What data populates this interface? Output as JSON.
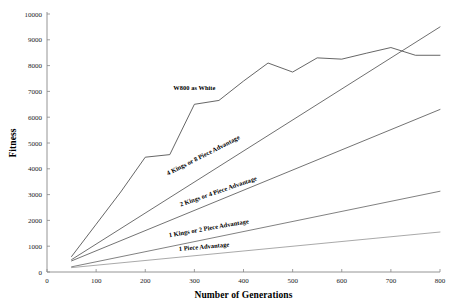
{
  "chart_data": {
    "type": "line",
    "title": "",
    "xlabel": "Number of Generations",
    "ylabel": "Fitness",
    "xlim": [
      0,
      800
    ],
    "ylim": [
      0,
      10000
    ],
    "xticks": [
      0,
      100,
      200,
      300,
      400,
      500,
      600,
      700,
      800
    ],
    "yticks": [
      0,
      1000,
      2000,
      3000,
      4000,
      5000,
      6000,
      7000,
      8000,
      9000,
      10000
    ],
    "xtick_labels": [
      "0",
      "100",
      "200",
      "300",
      "400",
      "500",
      "600",
      "700",
      "800"
    ],
    "ytick_labels": [
      "0",
      "1000",
      "2000",
      "3000",
      "4000",
      "5000",
      "6000",
      "7000",
      "8000",
      "9000",
      "10000"
    ],
    "grid": false,
    "legend": "inline-labels",
    "background": "#ffffff",
    "series": [
      {
        "name": "W800 as White",
        "color": "#4a4a4a",
        "label_x": 300,
        "label_y": 7050,
        "label_rotation": 0,
        "x": [
          50,
          100,
          150,
          200,
          250,
          300,
          350,
          400,
          450,
          500,
          550,
          600,
          650,
          700,
          750,
          800
        ],
        "y": [
          600,
          1850,
          3100,
          4450,
          4550,
          6500,
          6650,
          7400,
          8100,
          7750,
          8300,
          8250,
          8480,
          8700,
          8400,
          8400
        ]
      },
      {
        "name": "4 Kings or 8 Piece Advantage",
        "color": "#555555",
        "label_x": 320,
        "label_y": 4450,
        "label_rotation": -27,
        "x": [
          50,
          800
        ],
        "y": [
          480,
          9500
        ]
      },
      {
        "name": "2 Kings or 4 Piece Advantage",
        "color": "#5a5a5a",
        "label_x": 350,
        "label_y": 3050,
        "label_rotation": -19,
        "x": [
          50,
          800
        ],
        "y": [
          430,
          6300
        ]
      },
      {
        "name": "1 Kings or 2 Piece Advantage",
        "color": "#6a6a6a",
        "label_x": 330,
        "label_y": 1620,
        "label_rotation": -10,
        "x": [
          50,
          800
        ],
        "y": [
          200,
          3130
        ]
      },
      {
        "name": "1 Piece Advantage",
        "color": "#9a9a9a",
        "label_x": 320,
        "label_y": 900,
        "label_rotation": -5,
        "x": [
          50,
          800
        ],
        "y": [
          170,
          1550
        ]
      }
    ]
  }
}
